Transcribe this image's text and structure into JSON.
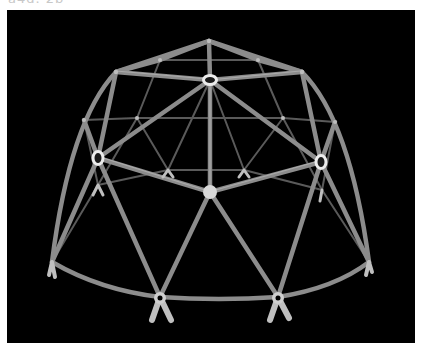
{
  "header": {
    "cut_off_text": "a4d.  2b"
  },
  "image": {
    "subject": "geodesic dome frame model",
    "background_color": "#000000",
    "strut_color": "#8a8a8a",
    "hub_color": "#e6e6e6"
  }
}
